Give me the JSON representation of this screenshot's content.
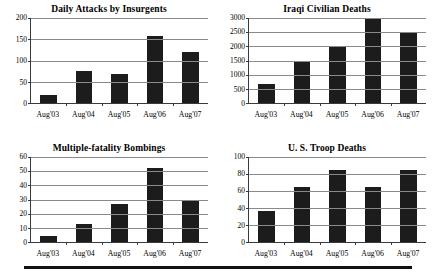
{
  "figure": {
    "name": "iraq-war-indicators-panel",
    "bottom_rule": true
  },
  "chart_data": [
    {
      "type": "bar",
      "title": "Daily Attacks by Insurgents",
      "categories": [
        "Aug'03",
        "Aug'04",
        "Aug'05",
        "Aug'06",
        "Aug'07"
      ],
      "values": [
        20,
        75,
        68,
        158,
        120
      ],
      "xlabel": "",
      "ylabel": "",
      "ylim": [
        0,
        200
      ],
      "yticks": [
        0,
        50,
        100,
        150,
        200
      ],
      "grid": true,
      "legend": null,
      "bar_color": "#1c1c1c"
    },
    {
      "type": "bar",
      "title": "Iraqi Civilian Deaths",
      "categories": [
        "Aug'03",
        "Aug'04",
        "Aug'05",
        "Aug'06",
        "Aug'07"
      ],
      "values": [
        680,
        1480,
        1980,
        3000,
        2480
      ],
      "xlabel": "",
      "ylabel": "",
      "ylim": [
        0,
        3000
      ],
      "yticks": [
        0,
        500,
        1000,
        1500,
        2000,
        2500,
        3000
      ],
      "grid": true,
      "legend": null,
      "bar_color": "#1c1c1c"
    },
    {
      "type": "bar",
      "title": "Multiple-fatality Bombings",
      "categories": [
        "Aug'03",
        "Aug'04",
        "Aug'05",
        "Aug'06",
        "Aug'07"
      ],
      "values": [
        4,
        13,
        27,
        52,
        30
      ],
      "xlabel": "",
      "ylabel": "",
      "ylim": [
        0,
        60
      ],
      "yticks": [
        0,
        10,
        20,
        30,
        40,
        50,
        60
      ],
      "grid": true,
      "legend": null,
      "bar_color": "#1c1c1c"
    },
    {
      "type": "bar",
      "title": "U. S. Troop Deaths",
      "categories": [
        "Aug'03",
        "Aug'04",
        "Aug'05",
        "Aug'06",
        "Aug'07"
      ],
      "values": [
        36,
        65,
        85,
        65,
        85
      ],
      "xlabel": "",
      "ylabel": "",
      "ylim": [
        0,
        100
      ],
      "yticks": [
        0,
        20,
        40,
        60,
        80,
        100
      ],
      "grid": true,
      "legend": null,
      "bar_color": "#1c1c1c"
    }
  ]
}
